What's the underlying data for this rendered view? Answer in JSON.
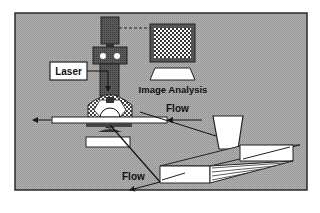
{
  "diagram": {
    "labels": {
      "laser": "Laser",
      "image_analysis": "Image Analysis",
      "flow_upper": "Flow",
      "flow_lower": "Flow"
    },
    "components": [
      {
        "id": "camera",
        "name": "Camera"
      },
      {
        "id": "lens-block",
        "name": "Lens block"
      },
      {
        "id": "laser",
        "name": "Laser"
      },
      {
        "id": "monitor",
        "name": "Image Analysis monitor"
      },
      {
        "id": "flow-cell",
        "name": "Optical flow cell"
      },
      {
        "id": "tube",
        "name": "Flow tube"
      },
      {
        "id": "hopper",
        "name": "Feed hopper"
      },
      {
        "id": "channel",
        "name": "Inclined channel"
      }
    ],
    "colors": {
      "background": "#a8a8a8",
      "frame_border": "#2a2a2a",
      "dark_component": "#555555",
      "white_component": "#ffffff",
      "line": "#1a1a1a"
    }
  }
}
